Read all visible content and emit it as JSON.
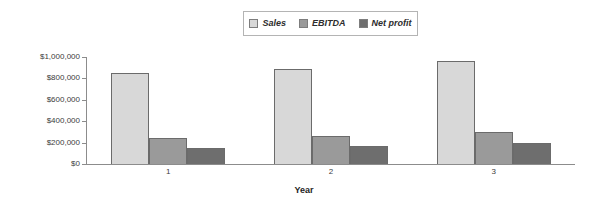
{
  "chart_data": {
    "type": "bar",
    "title": "",
    "xlabel": "Year",
    "ylabel": "",
    "categories": [
      "1",
      "2",
      "3"
    ],
    "series": [
      {
        "name": "Sales",
        "values": [
          850000,
          890000,
          965000
        ],
        "color": "#d8d8d8"
      },
      {
        "name": "EBITDA",
        "values": [
          245000,
          265000,
          300000
        ],
        "color": "#9a9a9a"
      },
      {
        "name": "Net profit",
        "values": [
          150000,
          170000,
          195000
        ],
        "color": "#6e6e6e"
      }
    ],
    "ylim": [
      0,
      1000000
    ],
    "ytick_values": [
      0,
      200000,
      400000,
      600000,
      800000,
      1000000
    ],
    "ytick_labels": [
      "$0",
      "$200,000",
      "$400,000",
      "$600,000",
      "$800,000",
      "$1,000,000"
    ],
    "grid": false,
    "legend_position": "top-center"
  },
  "legend": {
    "items": [
      {
        "label": "Sales",
        "color": "#d8d8d8"
      },
      {
        "label": "EBITDA",
        "color": "#9a9a9a"
      },
      {
        "label": "Net profit",
        "color": "#6e6e6e"
      }
    ]
  },
  "axes": {
    "x_title": "Year"
  }
}
